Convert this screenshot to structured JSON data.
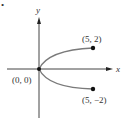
{
  "figure": {
    "marker": "•",
    "axes": {
      "x_label": "x",
      "y_label": "y"
    },
    "points": [
      {
        "id": "origin",
        "label": "(0, 0)",
        "x": 0,
        "y": 0
      },
      {
        "id": "upper",
        "label": "(5, 2)",
        "x": 5,
        "y": 2
      },
      {
        "id": "lower",
        "label": "(5, −2)",
        "x": 5,
        "y": -2
      }
    ],
    "curve": {
      "description": "sideways parabola x = (5/4) y^2 from (5, -2) through (0, 0) to (5, 2)",
      "color": "#7a7a7a"
    },
    "colors": {
      "axis": "#444444",
      "point": "#111111",
      "text": "#333333"
    }
  }
}
